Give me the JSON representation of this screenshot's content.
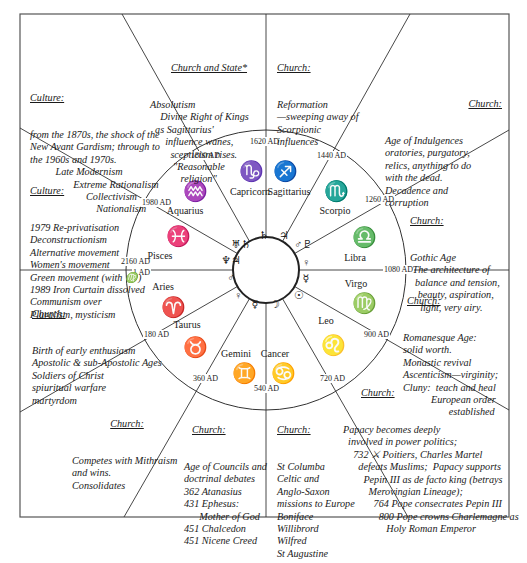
{
  "diagram": {
    "type": "astrological-ages-wheel",
    "center": {
      "x": 266,
      "y": 270
    },
    "outer_radius": 140,
    "inner_radius": 33,
    "line_color": "#333333"
  },
  "dates": [
    {
      "label": "1620 AD",
      "x": 249,
      "y": 137
    },
    {
      "label": "1800 AD",
      "x": 190,
      "y": 151
    },
    {
      "label": "1440 AD",
      "x": 316,
      "y": 151
    },
    {
      "label": "1980 AD",
      "x": 141,
      "y": 198
    },
    {
      "label": "1260 AD",
      "x": 364,
      "y": 195
    },
    {
      "label": "2160 AD",
      "x": 120,
      "y": 257
    },
    {
      "label": "1 AD",
      "x": 132,
      "y": 268
    },
    {
      "label": "1080 AD",
      "x": 383,
      "y": 265
    },
    {
      "label": "180 AD",
      "x": 143,
      "y": 330
    },
    {
      "label": "900 AD",
      "x": 363,
      "y": 330
    },
    {
      "label": "360 AD",
      "x": 192,
      "y": 374
    },
    {
      "label": "720 AD",
      "x": 319,
      "y": 374
    },
    {
      "label": "540 AD",
      "x": 253,
      "y": 384
    }
  ],
  "signs": [
    {
      "name": "Capricorn",
      "glyph": "♑",
      "label_x": 228,
      "label_y": 186,
      "glyph_x": 236,
      "glyph_y": 160
    },
    {
      "name": "Sagittarius",
      "glyph": "♐",
      "label_x": 267,
      "label_y": 186,
      "glyph_x": 270,
      "glyph_y": 160
    },
    {
      "name": "Aquarius",
      "glyph": "♒",
      "label_x": 163,
      "label_y": 205,
      "glyph_x": 180,
      "glyph_y": 180
    },
    {
      "name": "Scorpio",
      "glyph": "♏",
      "label_x": 313,
      "label_y": 205,
      "glyph_x": 321,
      "glyph_y": 180
    },
    {
      "name": "Pisces",
      "glyph": "♓",
      "label_x": 138,
      "label_y": 250,
      "glyph_x": 163,
      "glyph_y": 225
    },
    {
      "name": "Libra",
      "glyph": "♎",
      "label_x": 333,
      "label_y": 252,
      "glyph_x": 349,
      "glyph_y": 226
    },
    {
      "name": "Aries",
      "glyph": "♈",
      "label_x": 141,
      "label_y": 281,
      "glyph_x": 158,
      "glyph_y": 296
    },
    {
      "name": "Virgo",
      "glyph": "♍",
      "label_x": 334,
      "label_y": 278,
      "glyph_x": 349,
      "glyph_y": 292
    },
    {
      "name": "Taurus",
      "glyph": "♉",
      "label_x": 165,
      "label_y": 319,
      "glyph_x": 180,
      "glyph_y": 336
    },
    {
      "name": "Leo",
      "glyph": "♌",
      "label_x": 304,
      "label_y": 315,
      "glyph_x": 318,
      "glyph_y": 334
    },
    {
      "name": "Gemini",
      "glyph": "♊",
      "label_x": 214,
      "label_y": 348,
      "glyph_x": 229,
      "glyph_y": 362
    },
    {
      "name": "Cancer",
      "glyph": "♋",
      "label_x": 253,
      "label_y": 348,
      "glyph_x": 268,
      "glyph_y": 362
    }
  ],
  "planets": [
    {
      "glyph": "♄",
      "x": 252,
      "y": 229
    },
    {
      "glyph": "♃",
      "x": 272,
      "y": 229
    },
    {
      "glyph": "♅♄",
      "x": 229,
      "y": 238
    },
    {
      "glyph": "♂♇",
      "x": 291,
      "y": 238
    },
    {
      "glyph": "♆♃",
      "x": 219,
      "y": 254
    },
    {
      "glyph": "♀",
      "x": 294,
      "y": 256
    },
    {
      "glyph": "♂",
      "x": 219,
      "y": 271
    },
    {
      "glyph": "☿",
      "x": 294,
      "y": 272
    },
    {
      "glyph": "♀",
      "x": 226,
      "y": 289
    },
    {
      "glyph": "☉",
      "x": 287,
      "y": 289
    },
    {
      "glyph": "☿",
      "x": 243,
      "y": 298
    },
    {
      "glyph": "☽",
      "x": 263,
      "y": 298
    }
  ],
  "panels": {
    "church_and_state": {
      "heading": "Church and State*",
      "lines": "Absolutism\n    Divine Right of Kings\n  as Sagittarius'\n      influence wanes,\n        scepticism rises.\n         \"Reasonable\n            religion\""
    },
    "reformation": {
      "heading": "Church:",
      "lines": "Reformation\n—sweeping away of\nScorpionic\ninfluences"
    },
    "indulgences": {
      "heading": "Church:",
      "lines": "Age of Indulgences\noratories, purgatory,\nrelics, anything to do\nwith the dead.\nDecadence and\ncorruption"
    },
    "culture_modernism": {
      "heading": "Culture:",
      "lines": "from the 1870s, the shock of the\nNew Avant Gardism; through to\nthe 1960s and 1970s.\n          Late Modernism\n                 Extreme Rationalism\n                      Collectivism\n                          Nationalism"
    },
    "culture_postmodern": {
      "heading": "Culture:",
      "lines": "1979 Re-privatisation\nDeconstructionism\nAlternative movement\nWomen's movement\nGreen movement (with ♍)\n1989 Iron Curtain dissolved\nCommunism over\nPluralism, mysticism"
    },
    "gothic": {
      "heading": "Church:",
      "lines": "Gothic Age\n The architecture of\n  balance and tension,\n   beauty, aspiration,\n    light, very airy."
    },
    "romanesque": {
      "heading": "Church:",
      "lines": "Romanesque Age:\nsolid worth.\nMonastic revival\nAscenticism—virginity;\nCluny:  teach and heal\n           European order\n                  established"
    },
    "early_church": {
      "heading": "Church:",
      "lines": "Birth of early enthusiasm\nApostolic & sub-Apostolic Ages\nSoldiers of Christ\nspiuritual warfare\nmartyrdom"
    },
    "mithraism": {
      "heading": "Church:",
      "lines": "Competes with Mithraism\nand wins.\nConsolidates"
    },
    "councils": {
      "heading": "Church:",
      "lines": "Age of Councils and\ndoctrinal debates\n362 Atanasius\n431 Ephesus:\n      Mother of God\n451 Chalcedon\n451 Nicene Creed"
    },
    "missions": {
      "heading": "Church:",
      "lines": "St Columba\nCeltic and\nAnglo-Saxon\nmissions to Europe\nBoniface\nWillibrord\nWilfred\nSt Augustine"
    },
    "papacy": {
      "heading": "Church:",
      "lines": "Papacy becomes deeply\n  involved in power politics;\n    732 ⚔ Poitiers, Charles Martel\n      defeats Muslims;  Papacy supports\n        Pepin III as de facto king (betrays\n          Merovingian Lineage);\n            764 Pope consecrates Pepin III\n              800 Pope crowns Charlemagne as\n                 Holy Roman Emperor"
    }
  }
}
